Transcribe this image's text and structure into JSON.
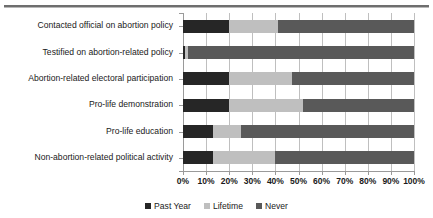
{
  "chart_data": {
    "type": "bar",
    "orientation": "horizontal",
    "stacked": true,
    "normalized_percent": true,
    "title": "",
    "subtitle": "",
    "xlabel": "",
    "ylabel": "",
    "xlim": [
      0,
      100
    ],
    "xticks": [
      "0%",
      "10%",
      "20%",
      "30%",
      "40%",
      "50%",
      "60%",
      "70%",
      "80%",
      "90%",
      "100%"
    ],
    "xtick_values": [
      0,
      10,
      20,
      30,
      40,
      50,
      60,
      70,
      80,
      90,
      100
    ],
    "grid": true,
    "grid_axis": "x",
    "legend_position": "bottom",
    "categories": [
      "Contacted official on abortion policy",
      "Testified on abortion-related policy",
      "Abortion-related electoral participation",
      "Pro-life demonstration",
      "Pro-life education",
      "Non-abortion-related political activity"
    ],
    "series": [
      {
        "name": "Past Year",
        "color": "#262626",
        "values": [
          20,
          1,
          20,
          20,
          13,
          13
        ]
      },
      {
        "name": "Lifetime",
        "color": "#bfbfbf",
        "values": [
          21,
          1,
          27,
          32,
          12,
          27
        ]
      },
      {
        "name": "Never",
        "color": "#595959",
        "values": [
          59,
          98,
          53,
          48,
          75,
          60
        ]
      }
    ],
    "axis_color": "#9a9a9a",
    "gridline_color": "#bfbfbf",
    "background": "#ffffff"
  },
  "legend": {
    "entries": [
      {
        "label": "Past Year"
      },
      {
        "label": "Lifetime"
      },
      {
        "label": "Never"
      }
    ]
  }
}
